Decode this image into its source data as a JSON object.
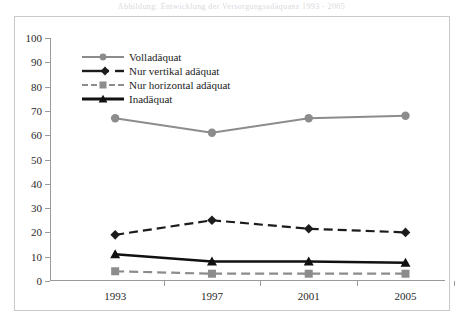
{
  "top_caption": "Abbildung: Entwicklung der Versorgungsadäquanz 1993 - 2005",
  "chart_data": {
    "type": "line",
    "title": "",
    "xlabel": "",
    "ylabel": "",
    "categories": [
      "1993",
      "1997",
      "2001",
      "2005"
    ],
    "x_tick_labels": [
      "1993",
      "1997",
      "2001",
      "2005"
    ],
    "y_tick_labels": [
      "0",
      "10",
      "20",
      "30",
      "40",
      "50",
      "60",
      "70",
      "80",
      "90",
      "100"
    ],
    "y_ticks": [
      0,
      10,
      20,
      30,
      40,
      50,
      60,
      70,
      80,
      90,
      100
    ],
    "ylim": [
      0,
      100
    ],
    "grid": false,
    "legend_position": "top-left-inside",
    "series": [
      {
        "name": "Volladäquat",
        "values": [
          67,
          61,
          67,
          68
        ],
        "color": "#8c8c8c",
        "marker": "circle",
        "dash": "solid",
        "width": 2
      },
      {
        "name": "Nur vertikal adäquat",
        "values": [
          19,
          25,
          21.5,
          20
        ],
        "color": "#1c1c1c",
        "marker": "diamond",
        "dash": "dashed",
        "width": 2.2
      },
      {
        "name": "Nur horizontal adäquat",
        "values": [
          4,
          3,
          3,
          3
        ],
        "color": "#8c8c8c",
        "marker": "square",
        "dash": "dashed",
        "width": 2.2
      },
      {
        "name": "Inadäquat",
        "values": [
          11,
          8,
          8,
          7.5
        ],
        "color": "#111111",
        "marker": "triangle",
        "dash": "solid",
        "width": 2.4
      }
    ]
  },
  "legend": {
    "items": [
      {
        "label": "Volladäquat"
      },
      {
        "label": "Nur vertikal adäquat"
      },
      {
        "label": "Nur horizontal adäquat"
      },
      {
        "label": "Inadäquat"
      }
    ]
  },
  "colors": {
    "gray_series": "#8c8c8c",
    "black_series": "#111111",
    "axis": "#9a9a9e",
    "frame": "#c9c9cd",
    "background": "#ffffff"
  }
}
